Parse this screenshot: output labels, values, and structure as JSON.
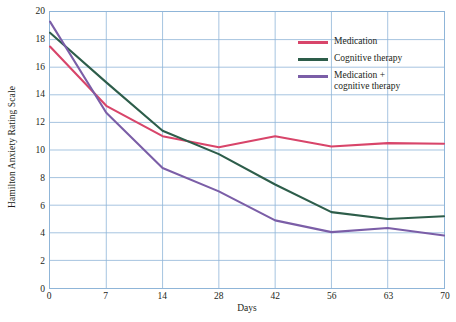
{
  "chart_data": {
    "type": "line",
    "title": "",
    "xlabel": "Days",
    "ylabel": "Hamilton Anxiety Rating Scale",
    "x_tick_labels": [
      "0",
      "7",
      "14",
      "28",
      "42",
      "56",
      "63",
      "70"
    ],
    "x_values": [
      0,
      7,
      14,
      28,
      42,
      56,
      63,
      70
    ],
    "y_tick_labels": [
      "20",
      "18",
      "16",
      "14",
      "12",
      "10",
      "8",
      "6",
      "4",
      "2",
      "0"
    ],
    "y_tick_values": [
      20,
      18,
      16,
      14,
      12,
      10,
      8,
      6,
      4,
      2,
      0
    ],
    "ylim": [
      0,
      20
    ],
    "grid": true,
    "grid_color": "#8fb5d8",
    "legend_position": "upper right",
    "series": [
      {
        "name": "Medication",
        "color": "#d8456a",
        "values": [
          17.5,
          13.2,
          11.0,
          10.2,
          11.0,
          10.25,
          10.5,
          10.45
        ]
      },
      {
        "name": "Cognitive therapy",
        "color": "#2d5d4a",
        "values": [
          18.5,
          14.9,
          11.4,
          9.7,
          7.5,
          5.5,
          5.0,
          5.2
        ]
      },
      {
        "name": "Medication +\ncognitive therapy",
        "color": "#7b5ea7",
        "values": [
          19.3,
          12.7,
          8.7,
          7.0,
          4.9,
          4.05,
          4.35,
          3.8
        ]
      }
    ]
  },
  "legend": {
    "items": [
      {
        "label": "Medication",
        "color": "#d8456a"
      },
      {
        "label": "Cognitive therapy",
        "color": "#2d5d4a"
      },
      {
        "label": "Medication +\ncognitive therapy",
        "color": "#7b5ea7"
      }
    ]
  },
  "axes": {
    "x_title": "Days",
    "y_title": "Hamilton Anxiety Rating Scale"
  }
}
